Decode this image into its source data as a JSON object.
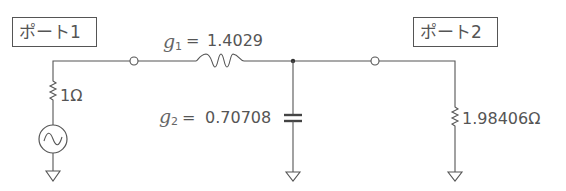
{
  "diagram": {
    "type": "ladder-filter-circuit",
    "ports": [
      {
        "id": "port1",
        "label": "ポート1"
      },
      {
        "id": "port2",
        "label": "ポート2"
      }
    ],
    "source": {
      "label": "",
      "resistance": "1Ω",
      "icon": "ac-source-icon"
    },
    "inductor": {
      "symbol": "g",
      "subscript": "1",
      "equals": "=",
      "value": "1.4029"
    },
    "capacitor": {
      "symbol": "g",
      "subscript": "2",
      "equals": "=",
      "value": "0.70708"
    },
    "load": {
      "resistance": "1.98406Ω"
    },
    "colors": {
      "line": "#555555",
      "text": "#555555"
    }
  }
}
